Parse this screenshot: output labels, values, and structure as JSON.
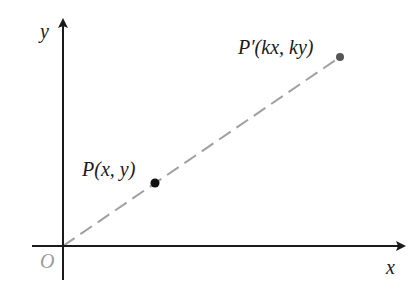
{
  "diagram": {
    "type": "coordinate-plane-dilation",
    "axes": {
      "x_label": "x",
      "y_label": "y",
      "origin_label": "O",
      "axis_color": "#1a1a1a",
      "origin_label_color": "#9a9a9a"
    },
    "line": {
      "style": "dashed",
      "color": "#a0a0a0",
      "from": "O",
      "to": "P'"
    },
    "points": [
      {
        "id": "P",
        "label_name": "P",
        "label_args": "(x, y)",
        "color": "#111111"
      },
      {
        "id": "P_prime",
        "label_name": "P′",
        "label_args": "(kx, ky)",
        "color": "#555555"
      }
    ]
  }
}
